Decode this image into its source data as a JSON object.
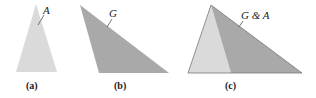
{
  "figures": [
    {
      "id": "a",
      "caption": "(a)",
      "label": "A",
      "fill": "#dadada",
      "points": "36,4 16,72 57,72",
      "leader": {
        "x1": 38,
        "y1": 25,
        "x2": 44,
        "y2": 15
      },
      "label_pos": {
        "x": 43,
        "y": 14
      },
      "caption_pos": {
        "x": 26,
        "y": 89
      }
    },
    {
      "id": "b",
      "caption": "(b)",
      "label": "G",
      "fill": "#a9a9a9",
      "points": "80,5 99,73 169,73",
      "leader": {
        "x1": 107,
        "y1": 27,
        "x2": 112,
        "y2": 19
      },
      "label_pos": {
        "x": 109,
        "y": 17
      },
      "caption_pos": {
        "x": 114,
        "y": 89
      }
    },
    {
      "id": "c",
      "caption": "(c)",
      "label": "G & A",
      "fill_light": "#dadada",
      "fill_dark": "#a9a9a9",
      "light_points": "211,5 188,73 231,73",
      "dark_points": "211,5 231,73 302,73",
      "outline_points": "211,5 188,73 302,73",
      "leader": {
        "x1": 239,
        "y1": 27,
        "x2": 243,
        "y2": 21
      },
      "label_pos": {
        "x": 241,
        "y": 19
      },
      "caption_pos": {
        "x": 225,
        "y": 89
      }
    }
  ]
}
